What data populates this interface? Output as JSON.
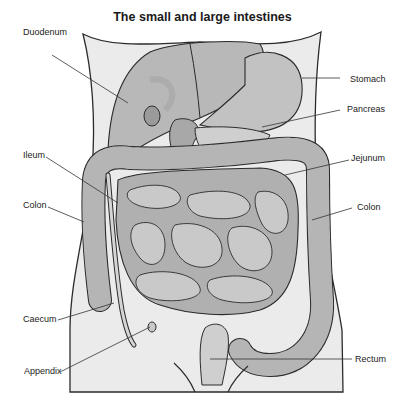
{
  "title": "The small and large intestines",
  "colors": {
    "body_fill": "#ebebeb",
    "organ_fill": "#b8b8b8",
    "organ_shade": "#9a9a9a",
    "organ_light": "#cccccc",
    "outline": "#2b2b2b",
    "leader": "#333333"
  },
  "labels": {
    "duodenum": "Duodenum",
    "stomach": "Stomach",
    "pancreas": "Pancreas",
    "ileum": "Ileum",
    "jejunum": "Jejunum",
    "colon_left": "Colon",
    "colon_right": "Colon",
    "caecum": "Caecum",
    "appendix": "Appendix",
    "rectum": "Rectum"
  }
}
